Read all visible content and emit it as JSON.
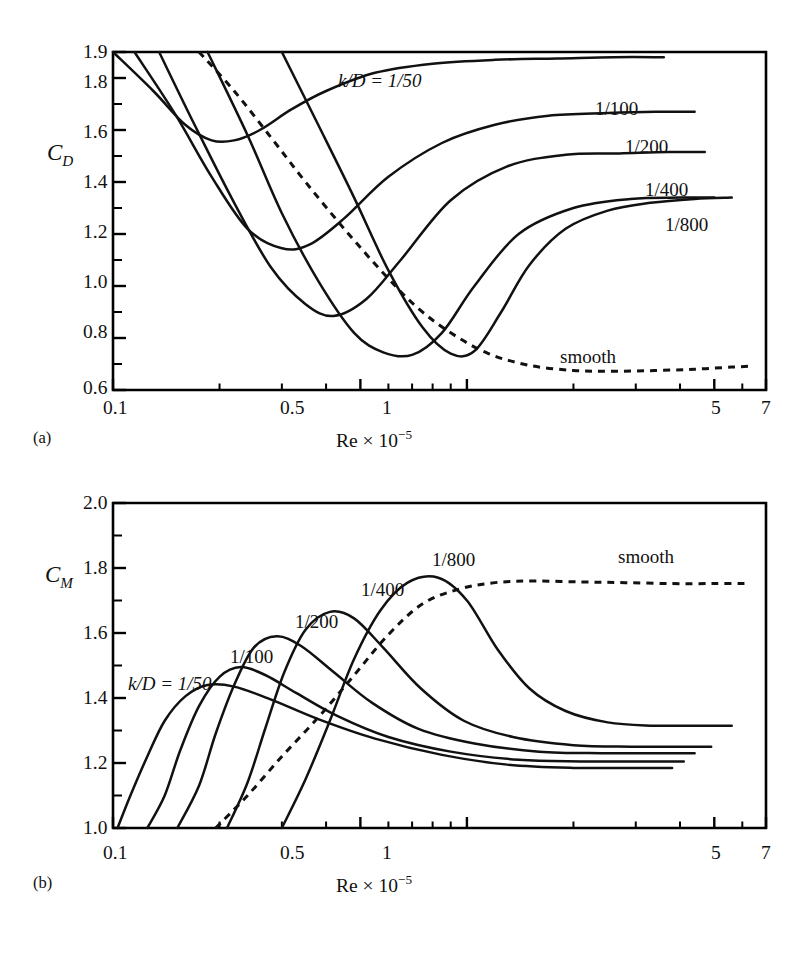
{
  "figure": {
    "panels": [
      {
        "letter": "(a)",
        "y_axis": {
          "symbol": "C",
          "subscript": "D",
          "ticks": [
            "0.6",
            "0.8",
            "1.0",
            "1.2",
            "1.4",
            "1.6",
            "1.8",
            "1.9"
          ],
          "min": 0.6,
          "max": 1.9
        },
        "x_axis": {
          "title_prefix": "Re × 10",
          "title_exponent": "−5",
          "ticks": [
            "0.1",
            "0.5",
            "1",
            "5",
            "7"
          ],
          "min": 0.1,
          "max": 7
        },
        "curve_labels": [
          "k/D = 1/50",
          "1/100",
          "1/200",
          "1/400",
          "1/800",
          "smooth"
        ]
      },
      {
        "letter": "(b)",
        "y_axis": {
          "symbol": "C",
          "subscript": "M",
          "ticks": [
            "1.0",
            "1.2",
            "1.4",
            "1.6",
            "1.8",
            "2.0"
          ],
          "min": 1.0,
          "max": 2.0
        },
        "x_axis": {
          "title_prefix": "Re × 10",
          "title_exponent": "−5",
          "ticks": [
            "0.1",
            "0.5",
            "1",
            "5",
            "7"
          ],
          "min": 0.1,
          "max": 7
        },
        "curve_labels": [
          "k/D = 1/50",
          "1/100",
          "1/200",
          "1/400",
          "1/800",
          "smooth"
        ]
      }
    ]
  },
  "chart_data": [
    {
      "type": "line",
      "title": "Drag coefficient vs Reynolds number for rough cylinders",
      "xlabel": "Re × 10−5",
      "ylabel": "C_D",
      "xscale": "log",
      "xlim": [
        0.1,
        7
      ],
      "ylim": [
        0.6,
        1.9
      ],
      "grid": false,
      "legend": "inline-curve-labels",
      "panel": "(a)",
      "xticks": [
        0.1,
        0.5,
        1,
        5,
        7
      ],
      "yticks": [
        0.6,
        0.8,
        1.0,
        1.2,
        1.4,
        1.6,
        1.8,
        1.9
      ],
      "series": [
        {
          "name": "k/D = 1/50",
          "style": "solid",
          "x": [
            0.1,
            0.13,
            0.16,
            0.19,
            0.22,
            0.26,
            0.32,
            0.4,
            0.55,
            0.8,
            1.2,
            1.8,
            2.6,
            3.6
          ],
          "y": [
            1.9,
            1.75,
            1.62,
            1.56,
            1.56,
            1.6,
            1.68,
            1.75,
            1.82,
            1.855,
            1.87,
            1.875,
            1.88,
            1.88
          ]
        },
        {
          "name": "1/100",
          "style": "solid",
          "x": [
            0.115,
            0.15,
            0.19,
            0.24,
            0.3,
            0.36,
            0.45,
            0.6,
            0.85,
            1.2,
            1.7,
            2.5,
            3.4,
            4.4
          ],
          "y": [
            1.9,
            1.66,
            1.42,
            1.22,
            1.145,
            1.16,
            1.26,
            1.42,
            1.55,
            1.62,
            1.655,
            1.665,
            1.67,
            1.67
          ]
        },
        {
          "name": "1/200",
          "style": "solid",
          "x": [
            0.135,
            0.17,
            0.22,
            0.28,
            0.35,
            0.42,
            0.52,
            0.65,
            0.9,
            1.3,
            1.9,
            2.7,
            3.7,
            4.7
          ],
          "y": [
            1.9,
            1.62,
            1.32,
            1.07,
            0.93,
            0.885,
            0.95,
            1.1,
            1.33,
            1.46,
            1.505,
            1.51,
            1.515,
            1.515
          ]
        },
        {
          "name": "1/400",
          "style": "solid",
          "x": [
            0.185,
            0.24,
            0.3,
            0.38,
            0.48,
            0.58,
            0.7,
            0.85,
            1.05,
            1.4,
            2.0,
            2.9,
            4.0,
            5.0
          ],
          "y": [
            1.9,
            1.58,
            1.28,
            1.02,
            0.82,
            0.745,
            0.735,
            0.82,
            1.0,
            1.2,
            1.3,
            1.335,
            1.34,
            1.34
          ]
        },
        {
          "name": "1/800",
          "style": "solid",
          "x": [
            0.3,
            0.38,
            0.48,
            0.6,
            0.75,
            0.9,
            1.05,
            1.25,
            1.5,
            1.9,
            2.5,
            3.3,
            4.4,
            5.6
          ],
          "y": [
            1.9,
            1.62,
            1.34,
            1.06,
            0.84,
            0.74,
            0.75,
            0.9,
            1.08,
            1.22,
            1.29,
            1.32,
            1.335,
            1.34
          ]
        },
        {
          "name": "smooth",
          "style": "dashed",
          "x": [
            0.175,
            0.22,
            0.28,
            0.35,
            0.45,
            0.58,
            0.72,
            0.9,
            1.15,
            1.5,
            2.0,
            2.6,
            3.4,
            4.4,
            5.6,
            6.4
          ],
          "y": [
            1.9,
            1.75,
            1.57,
            1.4,
            1.22,
            1.05,
            0.92,
            0.82,
            0.74,
            0.695,
            0.675,
            0.672,
            0.675,
            0.68,
            0.688,
            0.692
          ]
        }
      ]
    },
    {
      "type": "line",
      "title": "Inertia coefficient vs Reynolds number for rough cylinders",
      "xlabel": "Re × 10−5",
      "ylabel": "C_M",
      "xscale": "log",
      "xlim": [
        0.1,
        7
      ],
      "ylim": [
        1.0,
        2.0
      ],
      "grid": false,
      "legend": "inline-curve-labels",
      "panel": "(b)",
      "xticks": [
        0.1,
        0.5,
        1,
        5,
        7
      ],
      "yticks": [
        1.0,
        1.2,
        1.4,
        1.6,
        1.8,
        2.0
      ],
      "series": [
        {
          "name": "k/D = 1/50",
          "style": "solid",
          "x": [
            0.103,
            0.112,
            0.125,
            0.14,
            0.16,
            0.185,
            0.22,
            0.28,
            0.38,
            0.55,
            0.85,
            1.3,
            2.0,
            2.9,
            3.8
          ],
          "y": [
            1.0,
            1.1,
            1.22,
            1.33,
            1.405,
            1.44,
            1.435,
            1.395,
            1.335,
            1.275,
            1.225,
            1.195,
            1.185,
            1.185,
            1.185
          ]
        },
        {
          "name": "1/100",
          "style": "solid",
          "x": [
            0.125,
            0.14,
            0.155,
            0.175,
            0.2,
            0.23,
            0.27,
            0.33,
            0.43,
            0.6,
            0.9,
            1.4,
            2.1,
            3.1,
            4.1
          ],
          "y": [
            1.0,
            1.1,
            1.24,
            1.375,
            1.465,
            1.495,
            1.47,
            1.415,
            1.345,
            1.28,
            1.235,
            1.21,
            1.205,
            1.205,
            1.205
          ]
        },
        {
          "name": "1/200",
          "style": "solid",
          "x": [
            0.152,
            0.175,
            0.195,
            0.22,
            0.25,
            0.29,
            0.34,
            0.42,
            0.54,
            0.73,
            1.05,
            1.6,
            2.4,
            3.4,
            4.4
          ],
          "y": [
            1.0,
            1.13,
            1.29,
            1.44,
            1.555,
            1.59,
            1.56,
            1.48,
            1.385,
            1.305,
            1.26,
            1.235,
            1.23,
            1.23,
            1.23
          ]
        },
        {
          "name": "1/400",
          "style": "solid",
          "x": [
            0.21,
            0.24,
            0.27,
            0.305,
            0.35,
            0.41,
            0.48,
            0.58,
            0.74,
            0.98,
            1.35,
            2.0,
            2.9,
            3.9,
            4.9
          ],
          "y": [
            1.0,
            1.14,
            1.31,
            1.48,
            1.61,
            1.665,
            1.645,
            1.555,
            1.43,
            1.33,
            1.28,
            1.255,
            1.25,
            1.25,
            1.25
          ]
        },
        {
          "name": "1/800",
          "style": "solid",
          "x": [
            0.3,
            0.35,
            0.41,
            0.48,
            0.57,
            0.68,
            0.83,
            1.0,
            1.22,
            1.5,
            1.9,
            2.5,
            3.3,
            4.3,
            5.6
          ],
          "y": [
            1.0,
            1.15,
            1.33,
            1.52,
            1.67,
            1.755,
            1.77,
            1.7,
            1.55,
            1.43,
            1.36,
            1.325,
            1.315,
            1.315,
            1.315
          ]
        },
        {
          "name": "smooth",
          "style": "dashed",
          "x": [
            0.195,
            0.24,
            0.3,
            0.38,
            0.48,
            0.6,
            0.75,
            0.95,
            1.2,
            1.55,
            2.1,
            2.8,
            3.8,
            5.0,
            6.3
          ],
          "y": [
            1.0,
            1.1,
            1.22,
            1.34,
            1.47,
            1.595,
            1.69,
            1.735,
            1.755,
            1.76,
            1.757,
            1.755,
            1.752,
            1.752,
            1.752
          ]
        }
      ]
    }
  ]
}
